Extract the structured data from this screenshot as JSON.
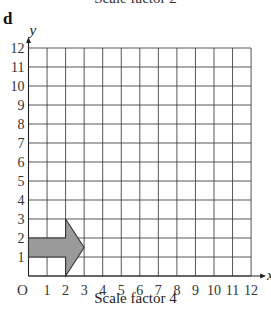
{
  "previous_caption": "Scale factor 2",
  "part_label": "d",
  "caption": "Scale factor 4",
  "axes": {
    "x_label": "x",
    "y_label": "y",
    "origin_label": "O",
    "x_ticks": [
      "1",
      "2",
      "3",
      "4",
      "5",
      "6",
      "7",
      "8",
      "9",
      "10",
      "11",
      "12"
    ],
    "y_ticks": [
      "1",
      "2",
      "3",
      "4",
      "5",
      "6",
      "7",
      "8",
      "9",
      "10",
      "11",
      "12"
    ]
  },
  "grid": {
    "x_min": 0,
    "x_max": 12,
    "y_min": 0,
    "y_max": 12
  },
  "shape": {
    "name": "arrow",
    "fill": "#9a9a9a",
    "stroke": "#333333",
    "vertices": [
      [
        0,
        1
      ],
      [
        0,
        2
      ],
      [
        2,
        2
      ],
      [
        2,
        3
      ],
      [
        3,
        1.5
      ],
      [
        2,
        0
      ],
      [
        2,
        1
      ]
    ]
  },
  "colors": {
    "grid": "#444444",
    "axis": "#222222"
  }
}
